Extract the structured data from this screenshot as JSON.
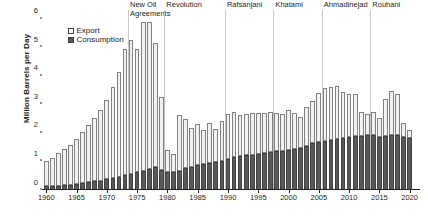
{
  "chart_data": {
    "type": "bar",
    "stacked": true,
    "title": "",
    "subtitle": "",
    "xlabel": "",
    "ylabel": "Million Barrels per Day",
    "ylim": [
      0,
      6.3
    ],
    "yticks": [
      0,
      1,
      2,
      3,
      4,
      5,
      6
    ],
    "ytick_labels": [
      "0",
      "1",
      "2",
      "3",
      "4",
      "5",
      "6"
    ],
    "xlim": [
      1959.3,
      2021.7
    ],
    "xticks": [
      1960,
      1965,
      1970,
      1975,
      1980,
      1985,
      1990,
      1995,
      2000,
      2005,
      2010,
      2015,
      2020
    ],
    "xtick_labels": [
      "1960",
      "1965",
      "1970",
      "1975",
      "1980",
      "1985",
      "1990",
      "1995",
      "2000",
      "2005",
      "2010",
      "2015",
      "2020"
    ],
    "grid": false,
    "legend_position": "upper-left",
    "legend": [
      {
        "name": "Export",
        "color": "#f2f2f2",
        "edge": "#808080"
      },
      {
        "name": "Consumption",
        "color": "#595959",
        "edge": "#404040"
      }
    ],
    "categories": [
      1960,
      1961,
      1962,
      1963,
      1964,
      1965,
      1966,
      1967,
      1968,
      1969,
      1970,
      1971,
      1972,
      1973,
      1974,
      1975,
      1976,
      1977,
      1978,
      1979,
      1980,
      1981,
      1982,
      1983,
      1984,
      1985,
      1986,
      1987,
      1988,
      1989,
      1990,
      1991,
      1992,
      1993,
      1994,
      1995,
      1996,
      1997,
      1998,
      1999,
      2000,
      2001,
      2002,
      2003,
      2004,
      2005,
      2006,
      2007,
      2008,
      2009,
      2010,
      2011,
      2012,
      2013,
      2014,
      2015,
      2016,
      2017,
      2018,
      2019,
      2020
    ],
    "series": [
      {
        "name": "Consumption",
        "values": [
          0.13,
          0.14,
          0.15,
          0.17,
          0.19,
          0.21,
          0.24,
          0.27,
          0.3,
          0.33,
          0.37,
          0.41,
          0.46,
          0.51,
          0.56,
          0.62,
          0.68,
          0.74,
          0.79,
          0.71,
          0.64,
          0.62,
          0.66,
          0.76,
          0.8,
          0.86,
          0.91,
          0.95,
          0.99,
          1.03,
          1.08,
          1.14,
          1.19,
          1.22,
          1.24,
          1.26,
          1.29,
          1.32,
          1.35,
          1.38,
          1.4,
          1.44,
          1.48,
          1.55,
          1.63,
          1.68,
          1.72,
          1.76,
          1.79,
          1.82,
          1.85,
          1.88,
          1.9,
          1.92,
          1.94,
          1.85,
          1.88,
          1.91,
          1.94,
          1.86,
          1.83
        ]
      },
      {
        "name": "Export",
        "values": [
          0.88,
          0.99,
          1.14,
          1.25,
          1.4,
          1.56,
          1.79,
          2.01,
          2.22,
          2.46,
          2.78,
          3.18,
          3.67,
          4.41,
          4.68,
          4.32,
          5.2,
          5.14,
          4.36,
          2.53,
          0.77,
          0.63,
          1.95,
          1.71,
          1.36,
          1.45,
          1.19,
          1.41,
          1.13,
          1.37,
          1.59,
          1.6,
          1.44,
          1.45,
          1.47,
          1.43,
          1.41,
          1.4,
          1.33,
          1.29,
          1.4,
          1.26,
          1.08,
          1.35,
          1.47,
          1.72,
          1.84,
          1.84,
          1.84,
          1.6,
          1.52,
          1.49,
          0.82,
          0.74,
          0.78,
          0.66,
          1.3,
          1.54,
          1.42,
          0.48,
          0.26
        ]
      }
    ],
    "events": [
      {
        "label": "New Oil\nAgreements",
        "label_line1": "New Oil",
        "label_line2": "Agreements",
        "year": 1973.5
      },
      {
        "label": "Revolution",
        "label_line1": "Revolution",
        "label_line2": "",
        "year": 1979.5
      },
      {
        "label": "Rafsanjani",
        "label_line1": "Rafsanjani",
        "label_line2": "",
        "year": 1989.5
      },
      {
        "label": "Khatami",
        "label_line1": "Khatami",
        "label_line2": "",
        "year": 1997.5
      },
      {
        "label": "Ahmadinejad",
        "label_line1": "Ahmadinejad",
        "label_line2": "",
        "year": 2005.5
      },
      {
        "label": "Rouhani",
        "label_line1": "Rouhani",
        "label_line2": "",
        "year": 2013.5
      }
    ]
  }
}
